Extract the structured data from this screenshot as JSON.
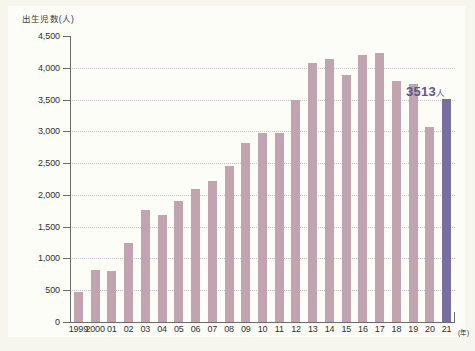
{
  "chart_data": {
    "type": "bar",
    "title": "",
    "ylabel": "出生児数(人)",
    "xlabel": "(年)",
    "ylim": [
      0,
      4500
    ],
    "ytick_step": 500,
    "grid": true,
    "legend": "none",
    "ytick_labels": [
      "4,500",
      "4,000",
      "3,500",
      "3,000",
      "2,500",
      "2,000",
      "1,500",
      "1,000",
      "500",
      "0"
    ],
    "ytick_values": [
      4500,
      4000,
      3500,
      3000,
      2500,
      2000,
      1500,
      1000,
      500,
      0
    ],
    "categories": [
      "1999",
      "2000",
      "01",
      "02",
      "03",
      "04",
      "05",
      "06",
      "07",
      "08",
      "09",
      "10",
      "11",
      "12",
      "13",
      "14",
      "15",
      "16",
      "17",
      "18",
      "19",
      "20",
      "21"
    ],
    "values": [
      470,
      820,
      800,
      1250,
      1770,
      1680,
      1900,
      2100,
      2220,
      2450,
      2820,
      2980,
      2970,
      3500,
      4070,
      4140,
      3880,
      4200,
      4230,
      3800,
      3750,
      3070,
      3513
    ],
    "highlight_index": 22,
    "annotations": [
      {
        "index": 22,
        "value": "3513",
        "unit": "人",
        "text": "3513人"
      }
    ],
    "colors": {
      "bar": "#c2a3b0",
      "bar_highlight": "#786f9e",
      "annotation_text": "#5d5590",
      "axis": "#6b6b6b",
      "gridline": "#c9bfc6",
      "background": "#fdfdf8"
    }
  }
}
